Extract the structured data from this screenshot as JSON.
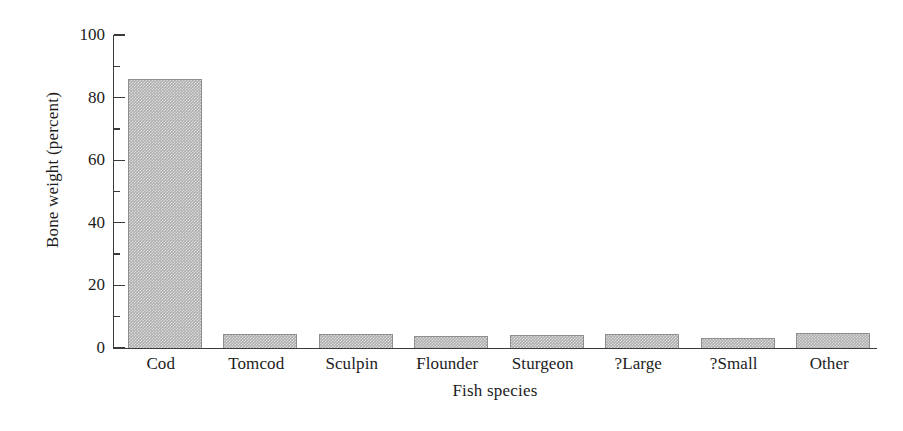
{
  "chart_data": {
    "type": "bar",
    "title": "",
    "subtitle": "",
    "xlabel": "Fish species",
    "ylabel": "Bone weight (percent)",
    "categories": [
      "Cod",
      "Tomcod",
      "Sculpin",
      "Flounder",
      "Sturgeon",
      "?Large",
      "?Small",
      "Other"
    ],
    "values": [
      85.5,
      4.0,
      4.2,
      3.6,
      3.9,
      4.1,
      2.8,
      4.5
    ],
    "ylim": [
      0,
      100
    ],
    "y_major_ticks": [
      0,
      20,
      40,
      60,
      80,
      100
    ],
    "y_minor_ticks": [
      10,
      30,
      50,
      70,
      90
    ],
    "y_tick_labels": [
      "0",
      "20",
      "40",
      "60",
      "80",
      "100"
    ],
    "grid": false,
    "legend": false,
    "legend_position": "none",
    "series": [
      {
        "name": "Bone weight",
        "values": [
          85.5,
          4.0,
          4.2,
          3.6,
          3.9,
          4.1,
          2.8,
          4.5
        ]
      }
    ],
    "colors": {
      "bar_fill": "#aeaeae",
      "bar_edge": "#8e8e8e",
      "axis": "#3a3a3a",
      "text": "#1c1c1c",
      "background": "#ffffff"
    }
  }
}
